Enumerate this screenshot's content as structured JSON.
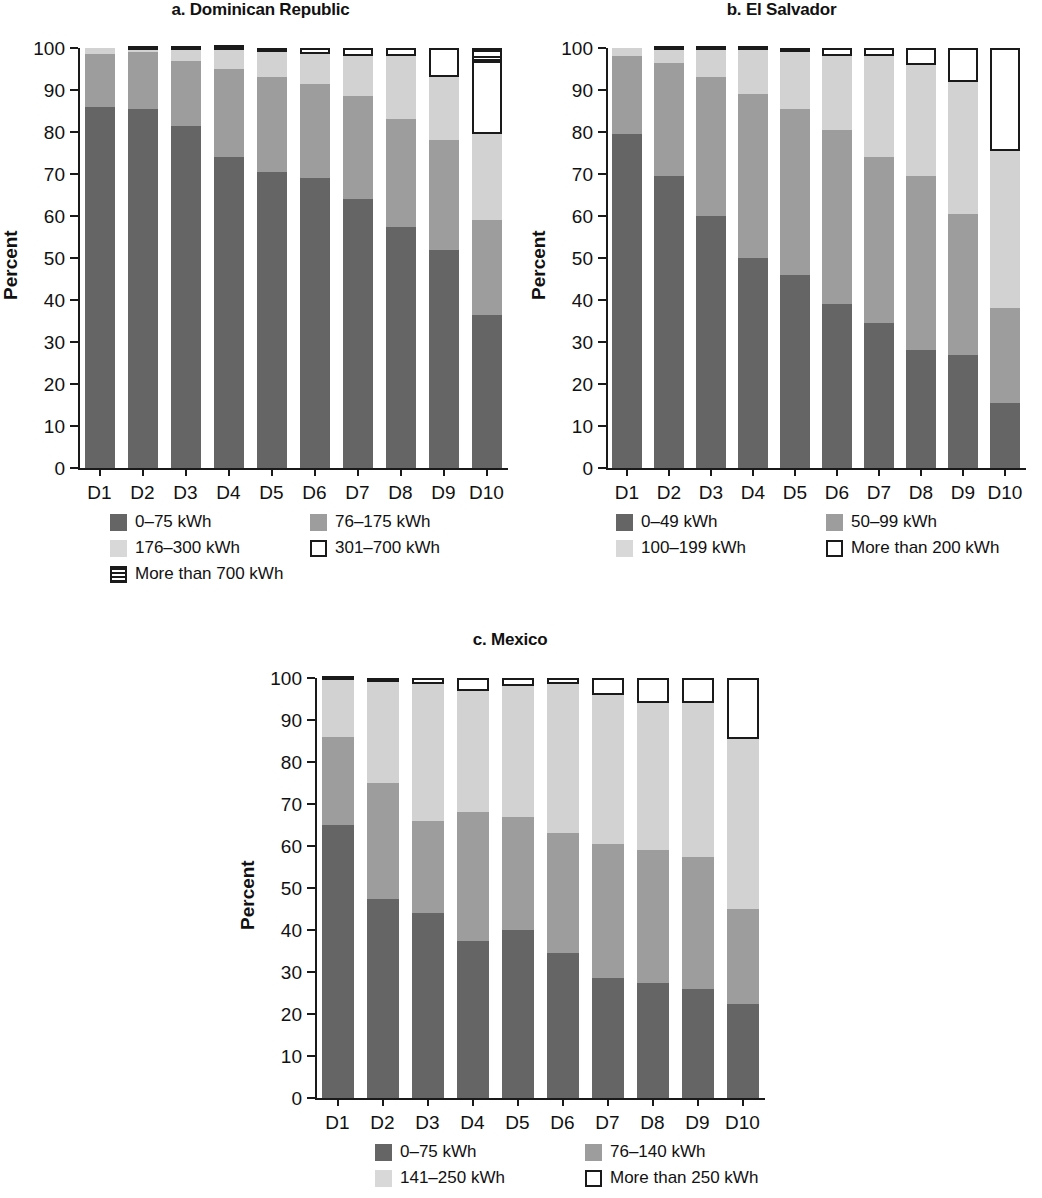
{
  "figure": {
    "y_axis_label": "Percent",
    "y_ticks": [
      "0",
      "10",
      "20",
      "30",
      "40",
      "50",
      "60",
      "70",
      "80",
      "90",
      "100"
    ],
    "x_categories": [
      "D1",
      "D2",
      "D3",
      "D4",
      "D5",
      "D6",
      "D7",
      "D8",
      "D9",
      "D10"
    ],
    "colors": {
      "series_1": "#656565",
      "series_2": "#9d9d9d",
      "series_3": "#d2d2d2",
      "series_4": "#ffffff",
      "series_5": "#ffffff",
      "axis": "#1a1a1a"
    }
  },
  "panels": [
    {
      "id": "a",
      "title": "a. Dominican Republic",
      "legend": [
        {
          "label": "0–75 kWh",
          "style": "s0"
        },
        {
          "label": "76–175 kWh",
          "style": "s1"
        },
        {
          "label": "176–300 kWh",
          "style": "s2"
        },
        {
          "label": "301–700 kWh",
          "style": "s3"
        },
        {
          "label": "More than 700 kWh",
          "style": "s4"
        }
      ]
    },
    {
      "id": "b",
      "title": "b. El Salvador",
      "legend": [
        {
          "label": "0–49 kWh",
          "style": "s0"
        },
        {
          "label": "50–99 kWh",
          "style": "s1"
        },
        {
          "label": "100–199 kWh",
          "style": "s2"
        },
        {
          "label": "More than 200 kWh",
          "style": "s3"
        }
      ]
    },
    {
      "id": "c",
      "title": "c. Mexico",
      "legend": [
        {
          "label": "0–75 kWh",
          "style": "s0"
        },
        {
          "label": "76–140 kWh",
          "style": "s1"
        },
        {
          "label": "141–250 kWh",
          "style": "s2"
        },
        {
          "label": "More than 250 kWh",
          "style": "s3"
        }
      ]
    }
  ],
  "chart_data": [
    {
      "type": "bar",
      "stacked": true,
      "title": "a. Dominican Republic",
      "xlabel": "",
      "ylabel": "Percent",
      "ylim": [
        0,
        100
      ],
      "grid": false,
      "legend_position": "below",
      "categories": [
        "D1",
        "D2",
        "D3",
        "D4",
        "D5",
        "D6",
        "D7",
        "D8",
        "D9",
        "D10"
      ],
      "series": [
        {
          "name": "0–75 kWh",
          "values": [
            86.0,
            85.5,
            81.5,
            74.0,
            70.5,
            69.0,
            64.0,
            57.5,
            52.0,
            36.5
          ]
        },
        {
          "name": "76–175 kWh",
          "values": [
            12.5,
            13.5,
            15.5,
            21.0,
            22.5,
            22.5,
            24.5,
            25.5,
            26.0,
            22.5
          ]
        },
        {
          "name": "176–300 kWh",
          "values": [
            1.5,
            0.5,
            2.5,
            4.5,
            6.0,
            7.0,
            9.5,
            15.0,
            15.0,
            20.5
          ]
        },
        {
          "name": "301–700 kWh",
          "values": [
            0.0,
            0.0,
            0.0,
            0.2,
            1.0,
            1.5,
            2.0,
            2.0,
            7.0,
            17.5
          ]
        },
        {
          "name": "More than 700 kWh",
          "values": [
            0.0,
            0.5,
            0.5,
            0.3,
            0.0,
            0.0,
            0.0,
            0.0,
            0.0,
            3.0
          ]
        }
      ]
    },
    {
      "type": "bar",
      "stacked": true,
      "title": "b. El Salvador",
      "xlabel": "",
      "ylabel": "Percent",
      "ylim": [
        0,
        100
      ],
      "grid": false,
      "legend_position": "below",
      "categories": [
        "D1",
        "D2",
        "D3",
        "D4",
        "D5",
        "D6",
        "D7",
        "D8",
        "D9",
        "D10"
      ],
      "series": [
        {
          "name": "0–49 kWh",
          "values": [
            79.5,
            69.5,
            60.0,
            50.0,
            46.0,
            39.0,
            34.5,
            28.0,
            27.0,
            15.5
          ]
        },
        {
          "name": "50–99 kWh",
          "values": [
            18.5,
            27.0,
            33.0,
            39.0,
            39.5,
            41.5,
            39.5,
            41.5,
            33.5,
            22.5
          ]
        },
        {
          "name": "100–199 kWh",
          "values": [
            2.0,
            3.0,
            6.5,
            10.5,
            13.5,
            17.5,
            24.0,
            26.5,
            31.5,
            37.5
          ]
        },
        {
          "name": "More than 200 kWh",
          "values": [
            0.0,
            0.5,
            0.5,
            0.5,
            1.0,
            2.0,
            2.0,
            4.0,
            8.0,
            24.5
          ]
        }
      ]
    },
    {
      "type": "bar",
      "stacked": true,
      "title": "c. Mexico",
      "xlabel": "",
      "ylabel": "Percent",
      "ylim": [
        0,
        100
      ],
      "grid": false,
      "legend_position": "below",
      "categories": [
        "D1",
        "D2",
        "D3",
        "D4",
        "D5",
        "D6",
        "D7",
        "D8",
        "D9",
        "D10"
      ],
      "series": [
        {
          "name": "0–75 kWh",
          "values": [
            65.0,
            47.5,
            44.0,
            37.5,
            40.0,
            34.5,
            28.5,
            27.5,
            26.0,
            22.5
          ]
        },
        {
          "name": "76–140 kWh",
          "values": [
            21.0,
            27.5,
            22.0,
            30.5,
            27.0,
            28.5,
            32.0,
            31.5,
            31.5,
            22.5
          ]
        },
        {
          "name": "141–250 kWh",
          "values": [
            13.5,
            24.0,
            32.5,
            29.0,
            31.0,
            35.5,
            35.5,
            35.0,
            36.5,
            40.5
          ]
        },
        {
          "name": "More than 250 kWh",
          "values": [
            0.5,
            1.0,
            1.5,
            3.0,
            2.0,
            1.5,
            4.0,
            6.0,
            6.0,
            14.5
          ]
        }
      ]
    }
  ]
}
